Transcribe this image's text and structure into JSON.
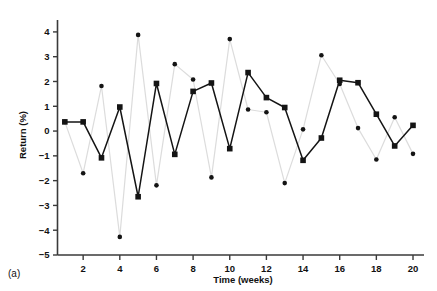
{
  "figure": {
    "panel_label": "(a)"
  },
  "chart_data": {
    "type": "line",
    "title": "",
    "xlabel": "Time (weeks)",
    "ylabel": "Return (%)",
    "x": [
      1,
      2,
      3,
      4,
      5,
      6,
      7,
      8,
      9,
      10,
      11,
      12,
      13,
      14,
      15,
      16,
      17,
      18,
      19,
      20
    ],
    "xlim": [
      0.6,
      20.6
    ],
    "ylim": [
      -5,
      4.4
    ],
    "xticks": [
      2,
      4,
      6,
      8,
      10,
      12,
      14,
      16,
      18,
      20
    ],
    "xticklabels": [
      "2",
      "4",
      "6",
      "8",
      "10",
      "12",
      "14",
      "16",
      "18",
      "20"
    ],
    "yticks": [
      -5,
      -4,
      -3,
      -2,
      -1,
      0,
      1,
      2,
      3,
      4
    ],
    "yticklabels": [
      "−5",
      "−4",
      "−3",
      "−2",
      "−1",
      "0",
      "1",
      "2",
      "3",
      "4"
    ],
    "grid": false,
    "legend": "none",
    "series": [
      {
        "name": "series-dark",
        "marker": "square",
        "color": "#141414",
        "line_color": "#141414",
        "values": [
          0.37,
          0.37,
          -1.08,
          0.97,
          -2.65,
          1.92,
          -0.94,
          1.6,
          1.94,
          -0.71,
          2.36,
          1.35,
          0.95,
          -1.18,
          -0.28,
          2.05,
          1.95,
          0.68,
          -0.6,
          0.23
        ]
      },
      {
        "name": "series-light",
        "marker": "circle",
        "color": "#141414",
        "line_color": "#dcdcdc",
        "values": [
          0.37,
          -1.7,
          1.82,
          -4.27,
          3.88,
          -2.19,
          2.7,
          2.08,
          -1.87,
          3.71,
          0.87,
          0.76,
          -2.1,
          0.07,
          3.06,
          1.9,
          0.12,
          -1.15,
          0.56,
          -0.92
        ]
      }
    ]
  }
}
